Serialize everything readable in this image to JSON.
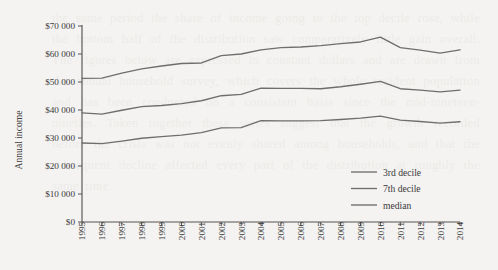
{
  "chart_data": {
    "type": "line",
    "title": "",
    "xlabel": "",
    "ylabel": "Annual income",
    "xlim": [
      1995,
      2014
    ],
    "ylim": [
      0,
      70000
    ],
    "grid": false,
    "legend_position": "bottom-right",
    "y_tick_labels": [
      "$0",
      "$10 000",
      "$20 000",
      "$30 000",
      "$40 000",
      "$50 000",
      "$60 000",
      "$70 000"
    ],
    "y_tick_values": [
      0,
      10000,
      20000,
      30000,
      40000,
      50000,
      60000,
      70000
    ],
    "x": [
      1995,
      1996,
      1997,
      1998,
      1999,
      2000,
      2001,
      2002,
      2003,
      2004,
      2005,
      2006,
      2007,
      2008,
      2009,
      2010,
      2011,
      2012,
      2013,
      2014
    ],
    "categories": [
      "1995",
      "1996",
      "1997",
      "1998",
      "1999",
      "2000",
      "2001",
      "2002",
      "2003",
      "2004",
      "2005",
      "2006",
      "2007",
      "2008",
      "2009",
      "2010",
      "2011",
      "2012",
      "2013",
      "2014"
    ],
    "series": [
      {
        "name": "3rd decile",
        "values": [
          28200,
          28000,
          28900,
          29900,
          30500,
          31000,
          31900,
          33600,
          33700,
          36200,
          36100,
          36100,
          36200,
          36600,
          37100,
          37800,
          36400,
          35900,
          35300,
          35800
        ]
      },
      {
        "name": "7th decile",
        "values": [
          51300,
          51400,
          53200,
          54700,
          55700,
          56600,
          56800,
          59400,
          60000,
          61500,
          62300,
          62500,
          63000,
          63700,
          64300,
          66000,
          62300,
          61400,
          60300,
          61500
        ]
      },
      {
        "name": "median",
        "values": [
          39000,
          38500,
          39900,
          41200,
          41600,
          42300,
          43300,
          45100,
          45600,
          47800,
          47700,
          47700,
          47600,
          48300,
          49200,
          50200,
          47600,
          47100,
          46500,
          47100
        ]
      }
    ],
    "legend_entries": [
      "3rd decile",
      "7th decile",
      "median"
    ],
    "series_color": "#6e6e6e",
    "axis_color": "#545454"
  },
  "page": {
    "background_color": "#f4f3f1",
    "bleed_text": "the same period the share of income going to the top decile rose, while the bottom half of the distribution saw comparatively little gain overall. The figures below are expressed in constant dollars and are drawn from the annual household survey, which covers the whole resident population and has been conducted on a consistent basis since the mid-nineteen-nineties. Taken together these series suggest that the growth recorded before the crisis was not evenly shared among households, and that the subsequent decline affected every part of the distribution at roughly the same time."
  }
}
